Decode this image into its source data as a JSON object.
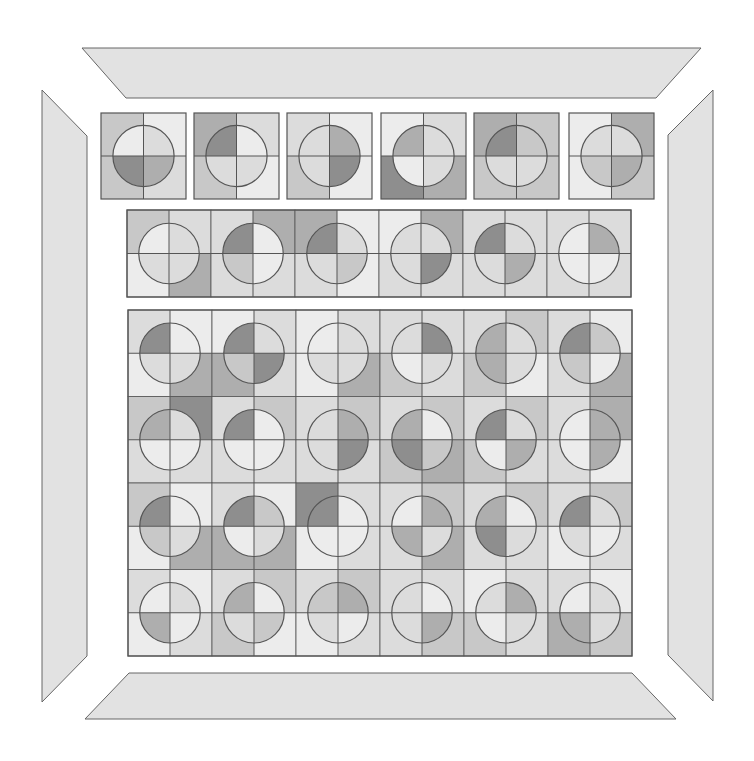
{
  "puzzle": {
    "shade_palette": [
      "#ececec",
      "#dcdcdc",
      "#c8c8c8",
      "#aeaeae",
      "#8e8e8e"
    ],
    "line_color": "#555555",
    "border_fill": "#e2e2e2",
    "tile_quadrant_order": "outer[TL,TR,BL,BR] inner[TL,TR,BL,BR]",
    "top_row": [
      {
        "outer": [
          2,
          0,
          2,
          1
        ],
        "inner": [
          0,
          1,
          4,
          3
        ]
      },
      {
        "outer": [
          3,
          1,
          2,
          0
        ],
        "inner": [
          4,
          0,
          1,
          1
        ]
      },
      {
        "outer": [
          1,
          0,
          2,
          0
        ],
        "inner": [
          1,
          3,
          1,
          4
        ]
      },
      {
        "outer": [
          0,
          1,
          4,
          3
        ],
        "inner": [
          3,
          1,
          0,
          1
        ]
      },
      {
        "outer": [
          3,
          2,
          2,
          2
        ],
        "inner": [
          4,
          2,
          1,
          1
        ]
      },
      {
        "outer": [
          0,
          3,
          0,
          2
        ],
        "inner": [
          1,
          1,
          2,
          3
        ]
      }
    ],
    "middle_strip": [
      {
        "outer": [
          2,
          1,
          0,
          3
        ],
        "inner": [
          0,
          1,
          1,
          1
        ]
      },
      {
        "outer": [
          1,
          3,
          1,
          1
        ],
        "inner": [
          4,
          0,
          2,
          0
        ]
      },
      {
        "outer": [
          3,
          0,
          1,
          0
        ],
        "inner": [
          4,
          1,
          1,
          2
        ]
      },
      {
        "outer": [
          0,
          3,
          1,
          1
        ],
        "inner": [
          1,
          1,
          1,
          4
        ]
      },
      {
        "outer": [
          1,
          1,
          1,
          1
        ],
        "inner": [
          4,
          1,
          1,
          3
        ]
      },
      {
        "outer": [
          1,
          1,
          1,
          1
        ],
        "inner": [
          0,
          3,
          0,
          0
        ]
      }
    ],
    "main_grid": [
      [
        {
          "outer": [
            1,
            0,
            0,
            3
          ],
          "inner": [
            4,
            0,
            1,
            1
          ]
        },
        {
          "outer": [
            0,
            1,
            3,
            1
          ],
          "inner": [
            4,
            1,
            2,
            4
          ]
        },
        {
          "outer": [
            0,
            1,
            0,
            3
          ],
          "inner": [
            0,
            1,
            1,
            1
          ]
        },
        {
          "outer": [
            1,
            1,
            2,
            1
          ],
          "inner": [
            1,
            4,
            0,
            1
          ]
        },
        {
          "outer": [
            1,
            2,
            2,
            0
          ],
          "inner": [
            3,
            1,
            3,
            1
          ]
        },
        {
          "outer": [
            1,
            0,
            1,
            3
          ],
          "inner": [
            4,
            2,
            2,
            0
          ]
        }
      ],
      [
        {
          "outer": [
            2,
            4,
            1,
            1
          ],
          "inner": [
            3,
            1,
            0,
            0
          ]
        },
        {
          "outer": [
            1,
            2,
            1,
            1
          ],
          "inner": [
            4,
            0,
            0,
            0
          ]
        },
        {
          "outer": [
            1,
            2,
            1,
            1
          ],
          "inner": [
            1,
            3,
            1,
            4
          ]
        },
        {
          "outer": [
            1,
            2,
            2,
            3
          ],
          "inner": [
            3,
            0,
            4,
            2
          ]
        },
        {
          "outer": [
            1,
            2,
            2,
            1
          ],
          "inner": [
            4,
            1,
            0,
            3
          ]
        },
        {
          "outer": [
            1,
            3,
            1,
            0
          ],
          "inner": [
            0,
            3,
            0,
            3
          ]
        }
      ],
      [
        {
          "outer": [
            2,
            0,
            0,
            3
          ],
          "inner": [
            4,
            0,
            2,
            1
          ]
        },
        {
          "outer": [
            1,
            0,
            3,
            3
          ],
          "inner": [
            4,
            2,
            0,
            1
          ]
        },
        {
          "outer": [
            4,
            1,
            0,
            1
          ],
          "inner": [
            4,
            0,
            0,
            0
          ]
        },
        {
          "outer": [
            1,
            2,
            1,
            3
          ],
          "inner": [
            0,
            3,
            3,
            1
          ]
        },
        {
          "outer": [
            1,
            2,
            1,
            1
          ],
          "inner": [
            3,
            0,
            4,
            1
          ]
        },
        {
          "outer": [
            1,
            2,
            0,
            1
          ],
          "inner": [
            4,
            1,
            1,
            0
          ]
        }
      ],
      [
        {
          "outer": [
            1,
            0,
            0,
            1
          ],
          "inner": [
            0,
            1,
            3,
            0
          ]
        },
        {
          "outer": [
            1,
            2,
            2,
            0
          ],
          "inner": [
            3,
            0,
            1,
            2
          ]
        },
        {
          "outer": [
            1,
            2,
            0,
            1
          ],
          "inner": [
            2,
            3,
            1,
            0
          ]
        },
        {
          "outer": [
            1,
            1,
            1,
            2
          ],
          "inner": [
            1,
            0,
            1,
            3
          ]
        },
        {
          "outer": [
            0,
            1,
            2,
            1
          ],
          "inner": [
            1,
            3,
            0,
            1
          ]
        },
        {
          "outer": [
            1,
            0,
            3,
            2
          ],
          "inner": [
            0,
            1,
            3,
            1
          ]
        }
      ]
    ],
    "layout": {
      "top_row": {
        "xs": [
          101,
          194,
          287,
          381,
          474,
          569
        ],
        "y": 113,
        "w": 85,
        "h": 86
      },
      "middle_strip": {
        "x": 127,
        "y": 210,
        "cw": 84,
        "h": 87
      },
      "main_grid": {
        "x": 128,
        "y": 310,
        "cw": 84,
        "rh": 86.5
      }
    }
  }
}
